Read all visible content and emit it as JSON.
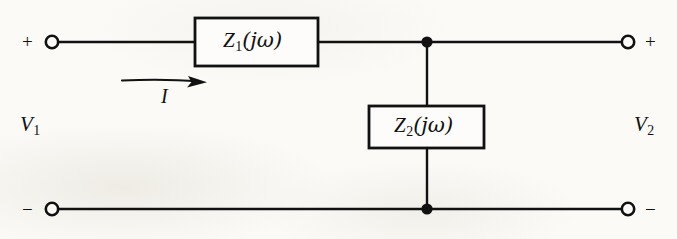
{
  "figure": {
    "background_color": "#fbfaf7",
    "ink_color": "#111111"
  },
  "components": {
    "series_impedance": {
      "name": "Z1",
      "label_z": "Z",
      "label_sub": "1",
      "label_arg": "(jω)",
      "full_label": "Z₁(jω)",
      "box": {
        "x": 195,
        "y": 18,
        "width": 123,
        "height": 48
      }
    },
    "shunt_impedance": {
      "name": "Z2",
      "label_z": "Z",
      "label_sub": "2",
      "label_arg": "(jω)",
      "full_label": "Z₂(jω)",
      "box": {
        "x": 369,
        "y": 106,
        "width": 115,
        "height": 42
      }
    }
  },
  "ports": {
    "input": {
      "name": "V1",
      "label_v": "V",
      "label_sub": "1",
      "full_label": "V₁",
      "plus_sign": "+",
      "minus_sign": "−",
      "terminal_top": {
        "x": 52,
        "y": 42
      },
      "terminal_bottom": {
        "x": 52,
        "y": 209
      }
    },
    "output": {
      "name": "V2",
      "label_v": "V",
      "label_sub": "2",
      "full_label": "V₂",
      "plus_sign": "+",
      "minus_sign": "−",
      "terminal_top": {
        "x": 628,
        "y": 42
      },
      "terminal_bottom": {
        "x": 628,
        "y": 209
      }
    }
  },
  "current": {
    "name": "I",
    "label": "I",
    "direction": "right",
    "arrow_from_x": 122,
    "arrow_to_x": 205,
    "arrow_y": 82
  },
  "nodes": {
    "top_junction": {
      "x": 427,
      "y": 42
    },
    "bottom_junction": {
      "x": 427,
      "y": 209
    }
  },
  "wires": {
    "top_rail_y": 42,
    "bottom_rail_y": 209,
    "shunt_branch_x": 427
  }
}
